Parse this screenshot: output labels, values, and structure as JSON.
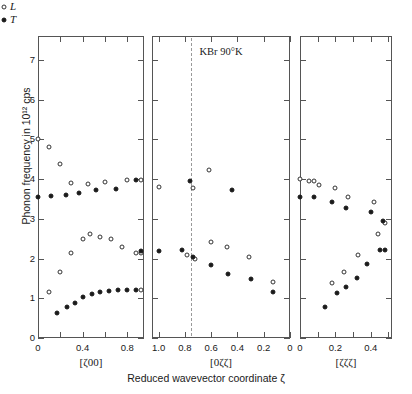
{
  "chart_data": {
    "type": "scatter",
    "title": "KBr 90°K",
    "ylabel": "Phonon frequency in 10¹² cps",
    "xlabel": "Reduced wavevector coordinate ζ",
    "ylim": [
      0,
      7.6
    ],
    "yticks": [
      0,
      1,
      2,
      3,
      4,
      5,
      6,
      7
    ],
    "yticklabels": [
      "0",
      "1",
      "2",
      "3",
      "4",
      "5",
      "6",
      "7"
    ],
    "grid": false,
    "legend": {
      "position": "top-center",
      "entries": [
        {
          "label": "L",
          "marker": "open-circle"
        },
        {
          "label": "T",
          "marker": "filled-circle"
        }
      ]
    },
    "panels": [
      {
        "name": "delta",
        "axis_label": "[ζ00]",
        "xlim": [
          0.0,
          0.95
        ],
        "xticks": [
          0.0,
          0.2,
          0.4,
          0.6,
          0.8
        ],
        "xticklabels": [
          "0",
          "",
          "0.4",
          "",
          "0.8"
        ],
        "reversed": false,
        "zone_boundary_line": false,
        "series": [
          {
            "name": "L",
            "marker": "open-circle",
            "points": [
              [
                0.0,
                5.0
              ],
              [
                0.1,
                4.8
              ],
              [
                0.2,
                4.38
              ],
              [
                0.3,
                3.9
              ],
              [
                0.45,
                3.88
              ],
              [
                0.6,
                3.92
              ],
              [
                0.8,
                3.98
              ],
              [
                0.92,
                3.98
              ],
              [
                0.1,
                1.15
              ],
              [
                0.2,
                1.65
              ],
              [
                0.3,
                2.13
              ],
              [
                0.4,
                2.48
              ],
              [
                0.47,
                2.62
              ],
              [
                0.56,
                2.55
              ],
              [
                0.65,
                2.48
              ],
              [
                0.75,
                2.28
              ],
              [
                0.88,
                2.15
              ],
              [
                0.92,
                2.15
              ],
              [
                0.92,
                1.2
              ]
            ]
          },
          {
            "name": "T",
            "marker": "filled-circle",
            "points": [
              [
                0.0,
                3.55
              ],
              [
                0.12,
                3.57
              ],
              [
                0.25,
                3.6
              ],
              [
                0.37,
                3.65
              ],
              [
                0.52,
                3.72
              ],
              [
                0.7,
                3.75
              ],
              [
                0.88,
                3.98
              ],
              [
                0.17,
                0.62
              ],
              [
                0.26,
                0.78
              ],
              [
                0.33,
                0.88
              ],
              [
                0.4,
                1.02
              ],
              [
                0.48,
                1.1
              ],
              [
                0.56,
                1.16
              ],
              [
                0.64,
                1.18
              ],
              [
                0.72,
                1.2
              ],
              [
                0.8,
                1.21
              ],
              [
                0.88,
                1.22
              ],
              [
                0.92,
                2.18
              ]
            ]
          }
        ]
      },
      {
        "name": "sigma",
        "axis_label": "[0ζζ]",
        "xlim": [
          0.0,
          1.05
        ],
        "xticks": [
          1.0,
          0.8,
          0.6,
          0.4,
          0.2,
          0.0
        ],
        "xticklabels": [
          "1.0",
          "0.8",
          "0.6",
          "0.4",
          "0.2",
          "0"
        ],
        "reversed": true,
        "zone_boundary_line": true,
        "zone_boundary_value": 0.75,
        "series": [
          {
            "name": "L",
            "marker": "open-circle",
            "points": [
              [
                1.0,
                3.8
              ],
              [
                0.74,
                3.78
              ],
              [
                0.62,
                4.22
              ],
              [
                0.78,
                2.1
              ],
              [
                0.72,
                1.98
              ],
              [
                0.6,
                2.42
              ],
              [
                0.48,
                2.3
              ],
              [
                0.31,
                2.03
              ],
              [
                0.13,
                1.42
              ]
            ]
          },
          {
            "name": "T",
            "marker": "filled-circle",
            "points": [
              [
                1.0,
                2.18
              ],
              [
                0.76,
                3.95
              ],
              [
                0.44,
                3.72
              ],
              [
                0.82,
                2.22
              ],
              [
                0.74,
                2.05
              ],
              [
                0.6,
                1.83
              ],
              [
                0.47,
                1.62
              ],
              [
                0.3,
                1.48
              ],
              [
                0.13,
                1.15
              ]
            ]
          }
        ]
      },
      {
        "name": "lambda",
        "axis_label": "[ζζζ]",
        "xlim": [
          0.0,
          0.52
        ],
        "xticks": [
          0.0,
          0.1,
          0.2,
          0.3,
          0.4,
          0.5
        ],
        "xticklabels": [
          "0",
          "",
          "0.2",
          "",
          "0.4",
          ""
        ],
        "reversed": false,
        "zone_boundary_line": false,
        "series": [
          {
            "name": "L",
            "marker": "open-circle",
            "points": [
              [
                0.0,
                4.0
              ],
              [
                0.05,
                3.95
              ],
              [
                0.08,
                3.95
              ],
              [
                0.11,
                3.85
              ],
              [
                0.2,
                3.78
              ],
              [
                0.27,
                3.55
              ],
              [
                0.42,
                3.42
              ],
              [
                0.18,
                1.38
              ],
              [
                0.25,
                1.65
              ],
              [
                0.33,
                2.1
              ],
              [
                0.44,
                2.62
              ],
              [
                0.48,
                2.9
              ]
            ]
          },
          {
            "name": "T",
            "marker": "filled-circle",
            "points": [
              [
                0.0,
                3.55
              ],
              [
                0.08,
                3.55
              ],
              [
                0.18,
                3.42
              ],
              [
                0.26,
                3.28
              ],
              [
                0.4,
                3.17
              ],
              [
                0.47,
                2.95
              ],
              [
                0.14,
                0.78
              ],
              [
                0.21,
                1.12
              ],
              [
                0.26,
                1.28
              ],
              [
                0.32,
                1.5
              ],
              [
                0.38,
                1.85
              ],
              [
                0.45,
                2.22
              ],
              [
                0.48,
                2.22
              ]
            ]
          }
        ]
      }
    ]
  }
}
